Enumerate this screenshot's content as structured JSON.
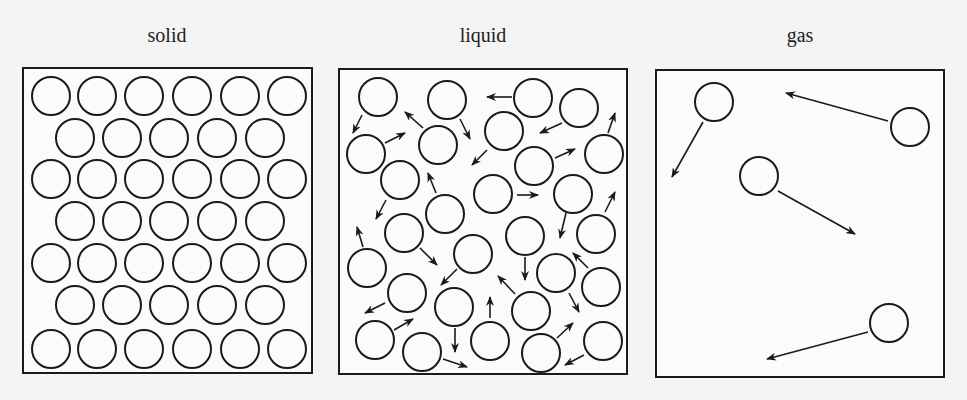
{
  "colors": {
    "background": "#f4f4f2",
    "box_fill": "#fbfbfa",
    "stroke": "#1a1a1a",
    "text": "#222222"
  },
  "particle_radius": 19,
  "panels": [
    {
      "id": "solid",
      "title": "solid",
      "title_x": 167,
      "title_y": 42,
      "box": {
        "x": 23,
        "y": 68,
        "w": 289,
        "h": 305
      },
      "particles": [
        [
          51,
          96
        ],
        [
          97,
          96
        ],
        [
          144,
          96
        ],
        [
          192,
          96
        ],
        [
          240,
          96
        ],
        [
          287,
          96
        ],
        [
          75,
          138
        ],
        [
          122,
          138
        ],
        [
          169,
          138
        ],
        [
          217,
          138
        ],
        [
          265,
          138
        ],
        [
          51,
          179
        ],
        [
          97,
          179
        ],
        [
          144,
          179
        ],
        [
          192,
          179
        ],
        [
          240,
          179
        ],
        [
          287,
          179
        ],
        [
          75,
          221
        ],
        [
          122,
          221
        ],
        [
          169,
          221
        ],
        [
          217,
          221
        ],
        [
          265,
          221
        ],
        [
          51,
          263
        ],
        [
          97,
          263
        ],
        [
          144,
          263
        ],
        [
          192,
          263
        ],
        [
          240,
          263
        ],
        [
          287,
          263
        ],
        [
          75,
          305
        ],
        [
          122,
          305
        ],
        [
          169,
          305
        ],
        [
          217,
          305
        ],
        [
          265,
          305
        ],
        [
          51,
          349
        ],
        [
          97,
          349
        ],
        [
          144,
          349
        ],
        [
          192,
          349
        ],
        [
          240,
          349
        ],
        [
          287,
          349
        ]
      ],
      "arrows": []
    },
    {
      "id": "liquid",
      "title": "liquid",
      "title_x": 483,
      "title_y": 42,
      "box": {
        "x": 339,
        "y": 69,
        "w": 288,
        "h": 305
      },
      "particles": [
        [
          378,
          97
        ],
        [
          447,
          100
        ],
        [
          533,
          98
        ],
        [
          579,
          108
        ],
        [
          366,
          154
        ],
        [
          438,
          145
        ],
        [
          504,
          131
        ],
        [
          534,
          166
        ],
        [
          604,
          154
        ],
        [
          400,
          180
        ],
        [
          493,
          194
        ],
        [
          573,
          194
        ],
        [
          445,
          214
        ],
        [
          404,
          233
        ],
        [
          525,
          236
        ],
        [
          596,
          234
        ],
        [
          367,
          268
        ],
        [
          473,
          254
        ],
        [
          556,
          273
        ],
        [
          601,
          287
        ],
        [
          407,
          293
        ],
        [
          454,
          307
        ],
        [
          531,
          311
        ],
        [
          375,
          340
        ],
        [
          422,
          352
        ],
        [
          490,
          341
        ],
        [
          541,
          353
        ],
        [
          603,
          341
        ]
      ],
      "arrows": [
        [
          362,
          115,
          353,
          133
        ],
        [
          423,
          128,
          405,
          112
        ],
        [
          460,
          119,
          470,
          139
        ],
        [
          512,
          97,
          487,
          97
        ],
        [
          562,
          123,
          540,
          133
        ],
        [
          608,
          133,
          615,
          113
        ],
        [
          385,
          143,
          405,
          133
        ],
        [
          487,
          150,
          472,
          165
        ],
        [
          555,
          158,
          575,
          149
        ],
        [
          386,
          200,
          376,
          219
        ],
        [
          436,
          193,
          428,
          173
        ],
        [
          517,
          195,
          538,
          195
        ],
        [
          605,
          212,
          615,
          192
        ],
        [
          566,
          213,
          560,
          238
        ],
        [
          363,
          247,
          357,
          227
        ],
        [
          420,
          248,
          437,
          265
        ],
        [
          457,
          269,
          441,
          285
        ],
        [
          525,
          257,
          525,
          280
        ],
        [
          588,
          268,
          573,
          253
        ],
        [
          515,
          294,
          498,
          276
        ],
        [
          569,
          293,
          579,
          312
        ],
        [
          385,
          303,
          365,
          313
        ],
        [
          490,
          318,
          490,
          297
        ],
        [
          394,
          330,
          413,
          319
        ],
        [
          455,
          328,
          455,
          352
        ],
        [
          443,
          359,
          467,
          367
        ],
        [
          557,
          338,
          573,
          323
        ],
        [
          584,
          355,
          565,
          365
        ]
      ]
    },
    {
      "id": "gas",
      "title": "gas",
      "title_x": 800,
      "title_y": 42,
      "box": {
        "x": 656,
        "y": 70,
        "w": 288,
        "h": 307
      },
      "particles": [
        [
          714,
          102
        ],
        [
          910,
          127
        ],
        [
          759,
          176
        ],
        [
          889,
          323
        ]
      ],
      "arrows": [
        [
          703,
          122,
          672,
          177
        ],
        [
          888,
          121,
          786,
          93
        ],
        [
          778,
          191,
          855,
          234
        ],
        [
          868,
          332,
          767,
          359
        ]
      ]
    }
  ]
}
